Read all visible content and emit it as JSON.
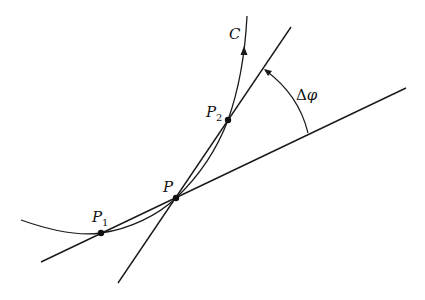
{
  "diagram": {
    "colors": {
      "stroke": "#1a1a1a",
      "background": "#ffffff"
    },
    "curve": {
      "label": "C",
      "direction_arrow": "up"
    },
    "points": [
      {
        "id": "P1",
        "label": "P",
        "subscript": "1",
        "x": 101,
        "y": 233
      },
      {
        "id": "P",
        "label": "P",
        "subscript": "",
        "x": 176,
        "y": 198
      },
      {
        "id": "P2",
        "label": "P",
        "subscript": "2",
        "x": 228,
        "y": 120
      }
    ],
    "lines": [
      {
        "id": "secant-p1-p",
        "from": [
          41,
          262
        ],
        "to": [
          406,
          88
        ]
      },
      {
        "id": "secant-p-p2",
        "from": [
          118,
          283
        ],
        "to": [
          291,
          27
        ]
      }
    ],
    "angle": {
      "label_prefix": "Δ",
      "label_symbol": "φ",
      "label": "Δφ"
    }
  }
}
